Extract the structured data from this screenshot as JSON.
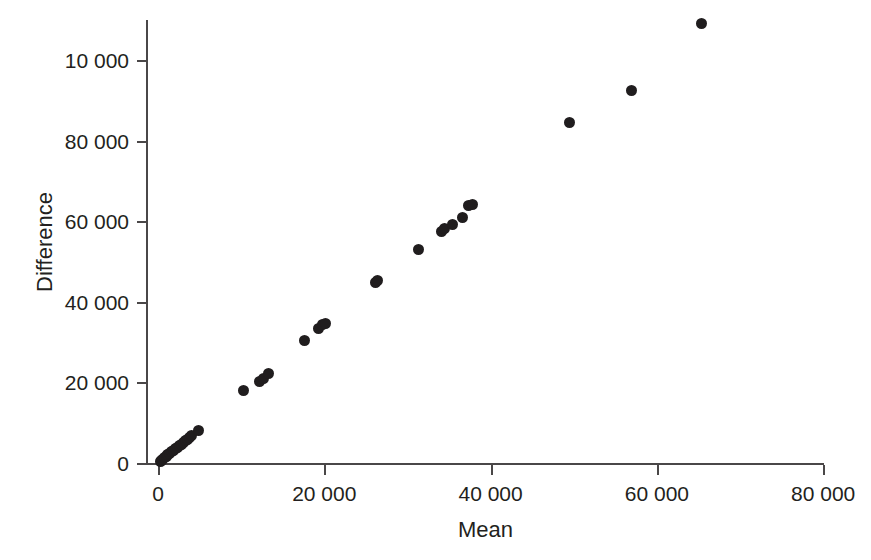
{
  "chart_data": {
    "type": "scatter",
    "title": "",
    "xlabel": "Mean",
    "ylabel": "Difference",
    "xlim": [
      0,
      81500
    ],
    "ylim": [
      0,
      113000
    ],
    "grid": false,
    "legend": null,
    "xticks": [
      0,
      20000,
      40000,
      60000,
      80000
    ],
    "xticklabels": [
      "0",
      "20 000",
      "40 000",
      "60 000",
      "80 000"
    ],
    "yticks": [
      0,
      20000,
      40000,
      60000,
      80000,
      100000
    ],
    "yticklabels": [
      "0",
      "20 000",
      "40 000",
      "60 000",
      "80 000",
      "10 000"
    ],
    "marker_color": "#201d1e",
    "marker_size_px": 11,
    "points": [
      {
        "x": 250,
        "y": 300
      },
      {
        "x": 420,
        "y": 620
      },
      {
        "x": 600,
        "y": 950
      },
      {
        "x": 800,
        "y": 1300
      },
      {
        "x": 1000,
        "y": 1650
      },
      {
        "x": 1200,
        "y": 2000
      },
      {
        "x": 1420,
        "y": 2350
      },
      {
        "x": 1650,
        "y": 2750
      },
      {
        "x": 1850,
        "y": 3100
      },
      {
        "x": 2080,
        "y": 3500
      },
      {
        "x": 2300,
        "y": 3900
      },
      {
        "x": 2550,
        "y": 4300
      },
      {
        "x": 2800,
        "y": 4700
      },
      {
        "x": 3050,
        "y": 5100
      },
      {
        "x": 3300,
        "y": 5550
      },
      {
        "x": 3550,
        "y": 5950
      },
      {
        "x": 3800,
        "y": 6400
      },
      {
        "x": 4050,
        "y": 6800
      },
      {
        "x": 4900,
        "y": 8000
      },
      {
        "x": 10300,
        "y": 17900
      },
      {
        "x": 12200,
        "y": 20200
      },
      {
        "x": 12700,
        "y": 20900
      },
      {
        "x": 13300,
        "y": 22100
      },
      {
        "x": 17600,
        "y": 30400
      },
      {
        "x": 19300,
        "y": 33300
      },
      {
        "x": 19800,
        "y": 34300
      },
      {
        "x": 20200,
        "y": 34500
      },
      {
        "x": 26100,
        "y": 44900
      },
      {
        "x": 26400,
        "y": 45300
      },
      {
        "x": 31300,
        "y": 52900
      },
      {
        "x": 34100,
        "y": 57400
      },
      {
        "x": 34500,
        "y": 58100
      },
      {
        "x": 35400,
        "y": 59200
      },
      {
        "x": 36600,
        "y": 61000
      },
      {
        "x": 37400,
        "y": 63800
      },
      {
        "x": 37800,
        "y": 64100
      },
      {
        "x": 49500,
        "y": 84500
      },
      {
        "x": 57000,
        "y": 92500
      },
      {
        "x": 65400,
        "y": 109000
      }
    ]
  }
}
